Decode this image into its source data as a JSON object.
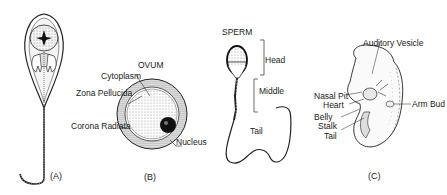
{
  "panels": {
    "a": {
      "caption": "(A)"
    },
    "b": {
      "title": "OVUM",
      "caption": "(B)",
      "labels": {
        "cytoplasm": "Cytoplasm",
        "zona_pellucida": "Zona Pellucida",
        "corona_radiata": "Corona Radiata",
        "nucleus": "Nucleus"
      }
    },
    "sperm": {
      "title": "SPERM",
      "labels": {
        "head": "Head",
        "middle": "Middle",
        "tail": "Tail"
      }
    },
    "c": {
      "caption": "(C)",
      "labels": {
        "auditory_vesicle": "Auditory Vesicle",
        "nasal_pit": "Nasal Pit",
        "heart": "Heart",
        "arm_bud": "Arm Bud",
        "belly": "Belly",
        "stalk": "Stalk",
        "tail": "Tail"
      }
    }
  }
}
